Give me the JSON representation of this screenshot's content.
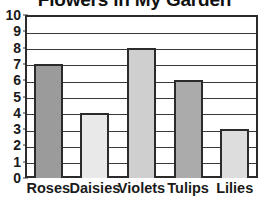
{
  "chart_data": {
    "type": "bar",
    "title": "Flowers in My Garden",
    "xlabel": "",
    "ylabel": "",
    "ylim": [
      0,
      10
    ],
    "grid": true,
    "legend": "none",
    "title_clipped": true,
    "categories": [
      "Roses",
      "Daisies",
      "Violets",
      "Tulips",
      "Lilies"
    ],
    "values": [
      7,
      4,
      8,
      6,
      3
    ],
    "y_ticks": [
      "0",
      "1",
      "2",
      "3",
      "4",
      "5",
      "6",
      "7",
      "8",
      "9",
      "10"
    ],
    "bar_colors": [
      "#9b9b9b",
      "#e9e9e9",
      "#cfcfcf",
      "#ababab",
      "#dddddd"
    ],
    "bar_outline_color": "#2b2b2b",
    "axis_color": "#2b2b2b",
    "gridline_color": "#3a3a3a",
    "background_color": "#ffffff",
    "text_color": "#1a1a1a",
    "bars": [
      {
        "label": "Roses",
        "value": 7,
        "color": "#9b9b9b"
      },
      {
        "label": "Daisies",
        "value": 4,
        "color": "#e9e9e9"
      },
      {
        "label": "Violets",
        "value": 8,
        "color": "#cfcfcf"
      },
      {
        "label": "Tulips",
        "value": 6,
        "color": "#ababab"
      },
      {
        "label": "Lilies",
        "value": 3,
        "color": "#dddddd"
      }
    ]
  }
}
